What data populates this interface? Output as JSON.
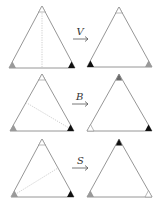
{
  "diagram": {
    "title": "",
    "colors": {
      "white": "#ffffff",
      "gray": "#9a9a9a",
      "dark_gray": "#6a6a6a",
      "black": "#111111",
      "edge": "#8a8a8a",
      "axis": "#c8c8c8"
    },
    "rows": [
      {
        "operation": "V",
        "axis_description": "vertical line from apex to base midpoint",
        "before": {
          "top": "white",
          "bottom_left": "gray",
          "bottom_right": "black"
        },
        "after": {
          "top": "white",
          "bottom_left": "black",
          "bottom_right": "gray"
        }
      },
      {
        "operation": "B",
        "axis_description": "line from left-side midpoint to bottom-right vertex",
        "before": {
          "top": "white",
          "bottom_left": "gray",
          "bottom_right": "black"
        },
        "after": {
          "top": "gray",
          "bottom_left": "white",
          "bottom_right": "black"
        }
      },
      {
        "operation": "S",
        "axis_description": "line from bottom-left vertex to right-side midpoint",
        "before": {
          "top": "white",
          "bottom_left": "gray",
          "bottom_right": "black"
        },
        "after": {
          "top": "black",
          "bottom_left": "gray",
          "bottom_right": "white"
        }
      }
    ]
  }
}
